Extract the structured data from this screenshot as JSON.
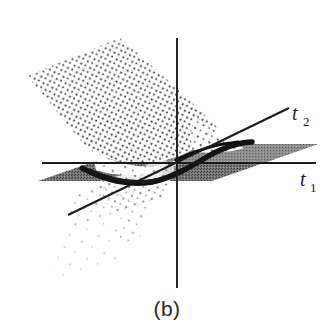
{
  "figure": {
    "caption": "(b)",
    "caption_name": "figure-caption",
    "background_color": "#ffffff",
    "ink_color": "#1b1b1b",
    "plane_fill_color": "#6e6e6e",
    "plane_fill_color_light": "#8a8a8a",
    "ridge_color": "#141414",
    "dot_color": "#262626",
    "axes": [
      {
        "id": "t1",
        "label": "t",
        "subscript": "1",
        "orientation": "horizontal",
        "label_x": 300,
        "label_y": 186
      },
      {
        "id": "t2",
        "label": "t",
        "subscript": "2",
        "orientation": "diagonal",
        "label_x": 291,
        "label_y": 120
      },
      {
        "id": "vertical",
        "label": "",
        "subscript": "",
        "orientation": "vertical",
        "label_x": 0,
        "label_y": 0
      }
    ],
    "geometry": {
      "origin": {
        "x": 177,
        "y": 163
      },
      "vertical_axis": {
        "x": 177,
        "y_top": 38,
        "y_bottom": 288
      },
      "horizontal_axis": {
        "y": 163,
        "x_left": 42,
        "x_right": 316
      },
      "diagonal_axis": {
        "x1": 68,
        "y1": 215,
        "x2": 289,
        "y2": 108
      },
      "plane_polygon": "38,181 145,144 318,144 212,181",
      "surface_patch_upper": "28,74 120,38 215,122 178,150 130,160 96,150",
      "surface_patch_lower": "70,196 160,160 125,252 52,268",
      "ridge_polyline": "85,170 120,176 150,180 178,172 210,158 245,146"
    },
    "elements": {
      "surface_upper_name": "dotted-surface-upper",
      "surface_lower_name": "dotted-surface-lower",
      "plane_name": "gray-reference-plane",
      "ridge_name": "surface-ridge-line"
    }
  }
}
